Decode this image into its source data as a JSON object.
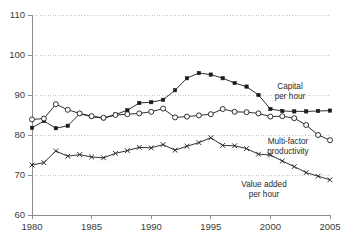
{
  "chart_data": {
    "type": "line",
    "title": "",
    "xlabel": "",
    "ylabel": "",
    "xlim": [
      1980,
      2005
    ],
    "ylim": [
      60,
      110
    ],
    "grid": true,
    "legend_position": "inline-annotations",
    "x": [
      1980,
      1981,
      1982,
      1983,
      1984,
      1985,
      1986,
      1987,
      1988,
      1989,
      1990,
      1991,
      1992,
      1993,
      1994,
      1995,
      1996,
      1997,
      1998,
      1999,
      2000,
      2001,
      2002,
      2003,
      2004,
      2005
    ],
    "xticks": [
      1980,
      1985,
      1990,
      1995,
      2000,
      2005
    ],
    "xtick_labels": [
      "1980",
      "1985",
      "1990",
      "1995",
      "2000",
      "2005"
    ],
    "yticks": [
      60,
      70,
      80,
      90,
      100,
      110
    ],
    "ytick_labels": [
      "60",
      "70",
      "80",
      "90",
      "100",
      "110"
    ],
    "series": [
      {
        "name": "Capital per hour",
        "marker": "filled-square",
        "values": [
          81.8,
          83.5,
          81.7,
          82.3,
          85.3,
          84.6,
          84.2,
          85.1,
          86.2,
          88.0,
          88.2,
          88.8,
          91.2,
          94.2,
          95.5,
          95.1,
          94.2,
          93.0,
          92.1,
          90.0,
          86.5,
          86.0,
          85.9,
          85.9,
          86.0,
          86.1
        ]
      },
      {
        "name": "Multi-factor productivity",
        "marker": "open-circle",
        "values": [
          83.9,
          84.1,
          87.7,
          86.3,
          85.4,
          84.7,
          84.3,
          85.0,
          85.2,
          85.4,
          85.8,
          86.6,
          84.4,
          84.6,
          84.9,
          85.2,
          86.5,
          85.8,
          85.7,
          85.4,
          84.6,
          84.7,
          84.2,
          82.5,
          80.0,
          78.7
        ]
      },
      {
        "name": "Value added per hour",
        "marker": "x-cross",
        "values": [
          72.5,
          73.1,
          76.0,
          74.7,
          75.1,
          74.5,
          74.3,
          75.4,
          76.1,
          76.9,
          76.8,
          77.6,
          76.2,
          77.2,
          78.1,
          79.3,
          77.4,
          77.3,
          76.6,
          75.2,
          75.0,
          73.5,
          72.1,
          70.6,
          69.7,
          68.8
        ]
      }
    ],
    "annotations": [
      {
        "id": "capital-label",
        "lines": [
          "Capital",
          "per hour"
        ],
        "x": 290,
        "y": 89
      },
      {
        "id": "mfp-label",
        "lines": [
          "Multi-factor",
          "productivity"
        ],
        "x": 288,
        "y": 144
      },
      {
        "id": "value-added-label",
        "lines": [
          "Value added",
          "per hour"
        ],
        "x": 264,
        "y": 187
      }
    ],
    "colors": {
      "series_line": "#1a1a1a",
      "grid": "#b9b9b9",
      "axis": "#8d8d8d",
      "text": "#3a3a3a",
      "background": "#ffffff"
    }
  }
}
